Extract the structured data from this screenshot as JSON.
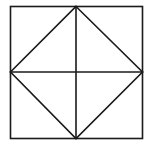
{
  "diagram": {
    "type": "geometric-figure",
    "stroke_color": "#1a1a1a",
    "background_color": "#ffffff",
    "square": {
      "x1": 10.5,
      "y1": 6.5,
      "x2": 142.5,
      "y2": 138.5
    },
    "diamond": {
      "points": [
        {
          "name": "top",
          "x": 76,
          "y": 6.5
        },
        {
          "name": "right",
          "x": 142.5,
          "y": 72
        },
        {
          "name": "bottom",
          "x": 76,
          "y": 138.5
        },
        {
          "name": "left",
          "x": 10.5,
          "y": 72
        }
      ]
    },
    "midlines": {
      "vertical": {
        "x": 76,
        "y1": 6.5,
        "y2": 138.5
      },
      "horizontal": {
        "y": 72,
        "x1": 10.5,
        "x2": 142.5
      }
    }
  }
}
